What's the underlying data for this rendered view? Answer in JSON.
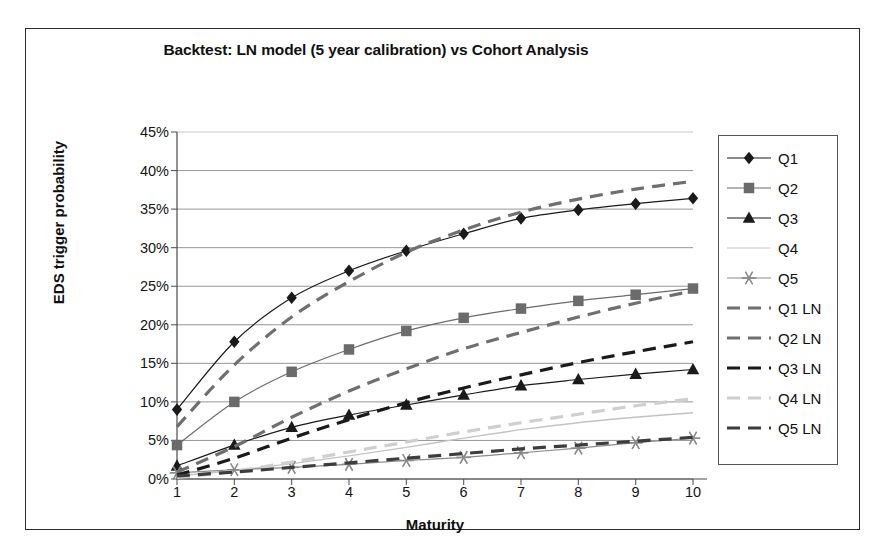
{
  "chart_data": {
    "type": "line",
    "title": "Backtest: LN model (5 year calibration) vs Cohort Analysis",
    "xlabel": "Maturity",
    "ylabel": "EDS trigger probability",
    "x": [
      1,
      2,
      3,
      4,
      5,
      6,
      7,
      8,
      9,
      10
    ],
    "xtick_labels": [
      "1",
      "2",
      "3",
      "4",
      "5",
      "6",
      "7",
      "8",
      "9",
      "10"
    ],
    "ytick_labels": [
      "0%",
      "5%",
      "10%",
      "15%",
      "20%",
      "25%",
      "30%",
      "35%",
      "40%",
      "45%"
    ],
    "ytick_values": [
      0,
      5,
      10,
      15,
      20,
      25,
      30,
      35,
      40,
      45
    ],
    "ylim": [
      0,
      45
    ],
    "xlim": [
      1,
      10
    ],
    "grid": "horizontal",
    "legend_position": "right",
    "value_unit": "%",
    "series": [
      {
        "name": "Q1",
        "style": "solid",
        "marker": "diamond",
        "color": "#1a1a1a",
        "width": 1.2,
        "values": [
          9.0,
          17.8,
          23.5,
          27.0,
          29.6,
          31.8,
          33.8,
          34.9,
          35.7,
          36.4
        ]
      },
      {
        "name": "Q2",
        "style": "solid",
        "marker": "square",
        "color": "#6b6b6b",
        "width": 1.2,
        "values": [
          4.4,
          10.0,
          13.9,
          16.8,
          19.2,
          20.9,
          22.1,
          23.1,
          23.9,
          24.7
        ]
      },
      {
        "name": "Q3",
        "style": "solid",
        "marker": "triangle",
        "color": "#1a1a1a",
        "width": 1.2,
        "values": [
          1.7,
          4.4,
          6.7,
          8.3,
          9.6,
          10.9,
          12.1,
          12.9,
          13.6,
          14.2
        ]
      },
      {
        "name": "Q4",
        "style": "solid",
        "marker": "none",
        "color": "#c3c3c3",
        "width": 1.4,
        "values": [
          0.4,
          1.1,
          2.0,
          3.0,
          4.1,
          5.3,
          6.4,
          7.3,
          8.0,
          8.6
        ]
      },
      {
        "name": "Q5",
        "style": "solid",
        "marker": "star",
        "color": "#8a8a8a",
        "width": 1.2,
        "values": [
          0.8,
          1.2,
          1.5,
          1.9,
          2.4,
          2.8,
          3.4,
          4.0,
          4.7,
          5.3
        ]
      },
      {
        "name": "Q1 LN",
        "style": "dashed",
        "marker": "none",
        "color": "#6f6f6f",
        "width": 3.2,
        "values": [
          6.8,
          14.8,
          21.0,
          25.6,
          29.4,
          32.3,
          34.6,
          36.3,
          37.6,
          38.6
        ]
      },
      {
        "name": "Q2 LN",
        "style": "dashed",
        "marker": "none",
        "color": "#6f6f6f",
        "width": 3.2,
        "values": [
          0.9,
          4.2,
          8.0,
          11.4,
          14.3,
          16.9,
          19.0,
          21.0,
          22.8,
          24.4
        ]
      },
      {
        "name": "Q3 LN",
        "style": "dashed",
        "marker": "none",
        "color": "#1a1a1a",
        "width": 3.2,
        "values": [
          0.5,
          2.7,
          5.3,
          7.7,
          9.9,
          11.8,
          13.5,
          15.1,
          16.5,
          17.8
        ]
      },
      {
        "name": "Q4 LN",
        "style": "dashed",
        "marker": "none",
        "color": "#cfcfcf",
        "width": 3.2,
        "values": [
          0.2,
          1.0,
          2.2,
          3.5,
          4.8,
          6.1,
          7.3,
          8.4,
          9.5,
          10.4
        ]
      },
      {
        "name": "Q5 LN",
        "style": "dashed",
        "marker": "none",
        "color": "#3d3d3d",
        "width": 3.2,
        "values": [
          0.4,
          0.9,
          1.5,
          2.1,
          2.7,
          3.3,
          3.9,
          4.4,
          4.9,
          5.4
        ]
      }
    ]
  },
  "legend": {
    "items": [
      {
        "label": "Q1"
      },
      {
        "label": "Q2"
      },
      {
        "label": "Q3"
      },
      {
        "label": "Q4"
      },
      {
        "label": "Q5"
      },
      {
        "label": "Q1 LN"
      },
      {
        "label": "Q2 LN"
      },
      {
        "label": "Q3 LN"
      },
      {
        "label": "Q4 LN"
      },
      {
        "label": "Q5 LN"
      }
    ]
  },
  "colors": {
    "frame": "#2b2b2b",
    "grid": "#8a8a8a",
    "axis": "#5a5a5a",
    "text": "#101010",
    "background": "#ffffff"
  }
}
